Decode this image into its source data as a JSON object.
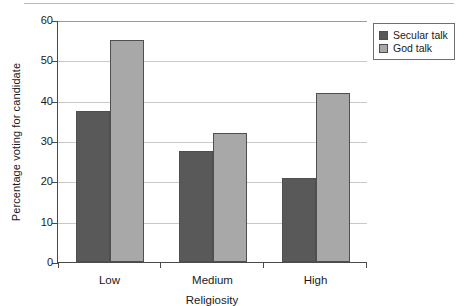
{
  "chart_data": {
    "type": "bar",
    "title": "",
    "xlabel": "Religiosity",
    "ylabel": "Percentage voting for candidate",
    "categories": [
      "Low",
      "Medium",
      "High"
    ],
    "series": [
      {
        "name": "Secular talk",
        "color": "#595959",
        "values": [
          37.5,
          27.5,
          20.8
        ]
      },
      {
        "name": "God talk",
        "color": "#a8a8a8",
        "values": [
          55.0,
          32.0,
          42.0
        ]
      }
    ],
    "ylim": [
      0,
      60
    ],
    "yticks": [
      0,
      10,
      20,
      30,
      40,
      50,
      60
    ],
    "ytick_labels": [
      "0",
      "10",
      "20",
      "30",
      "40",
      "50",
      "60"
    ],
    "grid": "horizontal",
    "legend_position": "top-right"
  }
}
